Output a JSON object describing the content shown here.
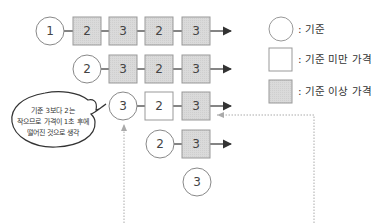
{
  "rows": [
    {
      "circle": "1",
      "boxes": [
        {
          "v": "2",
          "type": "above"
        },
        {
          "v": "3",
          "type": "above"
        },
        {
          "v": "2",
          "type": "above"
        },
        {
          "v": "3",
          "type": "above"
        }
      ]
    },
    {
      "circle": "2",
      "boxes": [
        {
          "v": "3",
          "type": "above"
        },
        {
          "v": "2",
          "type": "above"
        },
        {
          "v": "3",
          "type": "above"
        }
      ]
    },
    {
      "circle": "3",
      "boxes": [
        {
          "v": "2",
          "type": "below"
        },
        {
          "v": "3",
          "type": "above"
        }
      ]
    },
    {
      "circle": "2",
      "boxes": [
        {
          "v": "3",
          "type": "above"
        }
      ]
    },
    {
      "circle": "3",
      "boxes": []
    }
  ],
  "legend": {
    "baseline": ": 기준",
    "below": ": 기준 미만 가격",
    "above": ": 기준 이상 가격"
  },
  "bubble": {
    "line1": "기준 3보다 2는",
    "line2": "작으므로 가격이 1초 후에",
    "line3": "떨어진 것으로 생각"
  },
  "colors": {
    "above_fill": "#d9d9d9",
    "below_fill": "#ffffff",
    "stroke": "#888888",
    "dotted": "#aaaaaa"
  }
}
